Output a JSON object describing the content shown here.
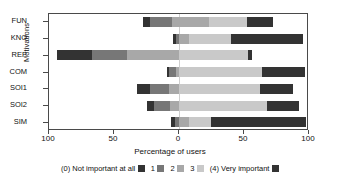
{
  "chart_data": {
    "type": "bar",
    "subtype": "diverging-stacked-horizontal",
    "title": "",
    "xlabel": "Percentage of users",
    "ylabel": "Motivations",
    "categories": [
      "FUN",
      "KNO",
      "REP",
      "COM",
      "SOI1",
      "SOI2",
      "SIM"
    ],
    "x_ticks": [
      -100,
      -50,
      0,
      50,
      100
    ],
    "x_tick_labels": [
      "100",
      "50",
      "0",
      "50",
      "100"
    ],
    "xlim": [
      -100,
      100
    ],
    "grid": false,
    "legend_position": "bottom",
    "legend_entries": [
      "(0) Not important at all",
      "1",
      "2",
      "3",
      "(4) Very important"
    ],
    "series": [
      {
        "name": "(0) Not important at all",
        "color": "#333333",
        "values": [
          6,
          3,
          50,
          2,
          6,
          5,
          3
        ]
      },
      {
        "name": "1",
        "color": "#777777",
        "values": [
          17,
          2,
          27,
          7,
          10,
          8,
          2
        ]
      },
      {
        "name": "2",
        "color": "#a8a8a8",
        "values": [
          28,
          8,
          38,
          26,
          24,
          22,
          14
        ]
      },
      {
        "name": "3",
        "color": "#c9c9c9",
        "values": [
          24,
          32,
          32,
          56,
          36,
          45,
          32
        ]
      },
      {
        "name": "(4) Very important",
        "color": "#333333",
        "values": [
          20,
          55,
          3,
          30,
          24,
          26,
          72
        ]
      }
    ],
    "bars": [
      {
        "category": "FUN",
        "start": -28,
        "end": 72,
        "segments": [
          {
            "level": "(0) Not important at all",
            "from": -28,
            "to": -22,
            "value": 6
          },
          {
            "level": "1",
            "from": -22,
            "to": -5,
            "value": 17
          },
          {
            "level": "2",
            "from": -5,
            "to": 23,
            "value": 28
          },
          {
            "level": "3",
            "from": 23,
            "to": 52,
            "value": 29
          },
          {
            "level": "(4) Very important",
            "from": 52,
            "to": 72,
            "value": 20
          }
        ]
      },
      {
        "category": "KNO",
        "start": -5,
        "end": 95,
        "segments": [
          {
            "level": "(0) Not important at all",
            "from": -5,
            "to": -2,
            "value": 3
          },
          {
            "level": "1",
            "from": -2,
            "to": 0,
            "value": 2
          },
          {
            "level": "2",
            "from": 0,
            "to": 8,
            "value": 8
          },
          {
            "level": "3",
            "from": 8,
            "to": 40,
            "value": 32
          },
          {
            "level": "(4) Very important",
            "from": 40,
            "to": 95,
            "value": 55
          }
        ]
      },
      {
        "category": "REP",
        "start": -94,
        "end": 56,
        "segments": [
          {
            "level": "(0) Not important at all",
            "from": -94,
            "to": -67,
            "value": 27
          },
          {
            "level": "1",
            "from": -67,
            "to": -40,
            "value": 27
          },
          {
            "level": "2",
            "from": -40,
            "to": 0,
            "value": 40
          },
          {
            "level": "3",
            "from": 0,
            "to": 53,
            "value": 53
          },
          {
            "level": "(4) Very important",
            "from": 53,
            "to": 56,
            "value": 3
          }
        ]
      },
      {
        "category": "COM",
        "start": -9,
        "end": 97,
        "segments": [
          {
            "level": "(0) Not important at all",
            "from": -9,
            "to": -8,
            "value": 1
          },
          {
            "level": "1",
            "from": -8,
            "to": -2,
            "value": 6
          },
          {
            "level": "2",
            "from": -2,
            "to": 0,
            "value": 2
          },
          {
            "level": "3",
            "from": 0,
            "to": 64,
            "value": 64
          },
          {
            "level": "(4) Very important",
            "from": 64,
            "to": 97,
            "value": 33
          }
        ]
      },
      {
        "category": "SOI1",
        "start": -32,
        "end": 88,
        "segments": [
          {
            "level": "(0) Not important at all",
            "from": -32,
            "to": -22,
            "value": 10
          },
          {
            "level": "1",
            "from": -22,
            "to": -8,
            "value": 14
          },
          {
            "level": "2",
            "from": -8,
            "to": 0,
            "value": 8
          },
          {
            "level": "3",
            "from": 0,
            "to": 62,
            "value": 62
          },
          {
            "level": "(4) Very important",
            "from": 62,
            "to": 88,
            "value": 26
          }
        ]
      },
      {
        "category": "SOI2",
        "start": -25,
        "end": 92,
        "segments": [
          {
            "level": "(0) Not important at all",
            "from": -25,
            "to": -19,
            "value": 6
          },
          {
            "level": "1",
            "from": -19,
            "to": -7,
            "value": 12
          },
          {
            "level": "2",
            "from": -7,
            "to": 0,
            "value": 7
          },
          {
            "level": "3",
            "from": 0,
            "to": 68,
            "value": 68
          },
          {
            "level": "(4) Very important",
            "from": 68,
            "to": 92,
            "value": 24
          }
        ]
      },
      {
        "category": "SIM",
        "start": -6,
        "end": 98,
        "segments": [
          {
            "level": "(0) Not important at all",
            "from": -6,
            "to": -3,
            "value": 3
          },
          {
            "level": "1",
            "from": -3,
            "to": 0,
            "value": 3
          },
          {
            "level": "2",
            "from": 0,
            "to": 8,
            "value": 8
          },
          {
            "level": "3",
            "from": 8,
            "to": 25,
            "value": 17
          },
          {
            "level": "(4) Very important",
            "from": 25,
            "to": 98,
            "value": 73
          }
        ]
      }
    ],
    "colors": {
      "level0": "#333333",
      "level1": "#737373",
      "level2": "#a6a6a6",
      "level3": "#cbcbcb",
      "level4": "#333333",
      "axis": "#4a4a4a",
      "zero_line": "#cfcfcf",
      "background": "#ffffff"
    }
  }
}
